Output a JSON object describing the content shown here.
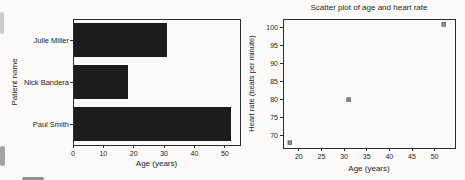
{
  "page": {
    "background": "#fbfaf8",
    "text_color": "#242424"
  },
  "chart_data": [
    {
      "type": "bar",
      "orientation": "horizontal",
      "title": "",
      "categories": [
        "Julie Miller",
        "Nick Bandera",
        "Paul Smith"
      ],
      "values": [
        31,
        18,
        52
      ],
      "xlabel": "Age (years)",
      "ylabel": "Patient name",
      "xlim": [
        0,
        55
      ],
      "xticks": [
        0,
        10,
        20,
        30,
        40,
        50
      ],
      "bar_color": "#1c1c1c",
      "frame_color": "#2b2b2b",
      "grid": false,
      "legend": "none"
    },
    {
      "type": "scatter",
      "title": "Scatter plot of age and heart rate",
      "x": [
        18,
        31,
        52
      ],
      "y": [
        68,
        80,
        101
      ],
      "xlabel": "Age (years)",
      "ylabel": "Heart rate (beats per minute)",
      "xlim": [
        16.5,
        54.5
      ],
      "ylim": [
        66.5,
        102.5
      ],
      "xticks": [
        20,
        25,
        30,
        35,
        40,
        45,
        50
      ],
      "yticks": [
        70,
        75,
        80,
        85,
        90,
        95,
        100
      ],
      "marker": {
        "shape": "square",
        "size": 3.6,
        "fill": "#8f8f8f",
        "stroke": "#5a5a5a"
      },
      "frame_color": "#2b2b2b",
      "grid": false,
      "legend": "none"
    }
  ]
}
